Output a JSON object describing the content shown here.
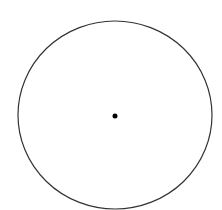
{
  "diagram": {
    "type": "circle-with-center-point",
    "canvas": {
      "width": 222,
      "height": 210,
      "background": "#ffffff"
    },
    "circle": {
      "cx": 115,
      "cy": 115,
      "rx": 97,
      "ry": 94,
      "stroke": "#333333",
      "stroke_width": 1.2,
      "fill": "none"
    },
    "center_point": {
      "cx": 115,
      "cy": 116,
      "r": 2.5,
      "fill": "#000000"
    }
  }
}
